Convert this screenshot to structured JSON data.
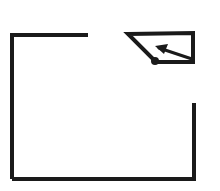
{
  "canvas": {
    "width": 220,
    "height": 191,
    "background_color": "#ffffff",
    "stroke_color": "#1a1a1a",
    "title": "Open rectangle outline with detached arrow pointer"
  },
  "chart_data": {
    "type": "diagram",
    "title": "Open rectangle outline with detached arrow pointer",
    "stroke_width_main": 4,
    "stroke_width_detail": 3,
    "elements": [
      {
        "name": "rectangle-top-left-segment",
        "type": "polyline",
        "points": [
          [
            88,
            35
          ],
          [
            12,
            35
          ],
          [
            12,
            179
          ]
        ],
        "stroke_width": 4,
        "note": "top edge runs leftward then turns down the full left side"
      },
      {
        "name": "rectangle-bottom-segment",
        "type": "polyline",
        "points": [
          [
            12,
            179
          ],
          [
            194,
            179
          ],
          [
            194,
            103
          ]
        ],
        "stroke_width": 4,
        "note": "bottom edge runs rightward then turns up the lower right side"
      },
      {
        "name": "pointer-outline",
        "type": "polygon",
        "points": [
          [
            128,
            34
          ],
          [
            193,
            33
          ],
          [
            193,
            62
          ],
          [
            156,
            62
          ]
        ],
        "closed": true,
        "stroke_width": 4,
        "note": "quadrilateral wedge: flat top, right vertical drop, then a long diagonal back up to the top-left tip"
      },
      {
        "name": "pointer-inner-arrow-tail",
        "type": "line",
        "points": [
          [
            159,
            48
          ],
          [
            192,
            59
          ]
        ],
        "stroke_width": 3,
        "note": "inner arrow shaft angled down to the right"
      },
      {
        "name": "pointer-inner-arrow-head",
        "type": "triangle",
        "points": [
          [
            155,
            46
          ],
          [
            168,
            44
          ],
          [
            164,
            54
          ]
        ],
        "note": "small filled arrowhead pointing up-left"
      },
      {
        "name": "pointer-vertex-dot",
        "type": "circle",
        "center": [
          155,
          61
        ],
        "radius": 4,
        "note": "filled round knob at the lower-left vertex of the wedge"
      }
    ],
    "gaps": [
      {
        "name": "top-edge-gap",
        "from_x": 88,
        "to_x": 194,
        "y": 35,
        "note": "missing span of the rectangle top edge"
      },
      {
        "name": "right-edge-gap",
        "x": 194,
        "from_y": 35,
        "to_y": 103,
        "note": "missing upper span of the rectangle right edge"
      }
    ]
  }
}
